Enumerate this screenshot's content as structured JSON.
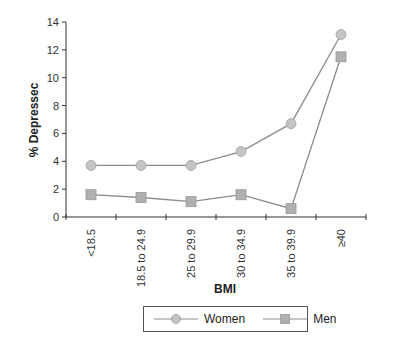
{
  "chart_data": {
    "type": "line",
    "title": "",
    "xlabel": "BMI",
    "ylabel": "% Depressec",
    "categories": [
      "<18.5",
      "18.5 to 24.9",
      "25 to 29.9",
      "30 to 34.9",
      "35 to 39.9",
      "≥40"
    ],
    "series": [
      {
        "name": "Women",
        "marker": "circle",
        "values": [
          3.7,
          3.7,
          3.7,
          4.7,
          6.7,
          13.1
        ]
      },
      {
        "name": "Men",
        "marker": "square",
        "values": [
          1.6,
          1.4,
          1.1,
          1.6,
          0.6,
          11.5
        ]
      }
    ],
    "ylim": [
      0,
      14
    ],
    "yticks": [
      0,
      2,
      4,
      6,
      8,
      10,
      12,
      14
    ],
    "grid": false,
    "legend_position": "bottom"
  },
  "colors": {
    "line": "#8c8c8c",
    "marker_fill": "#c4c4c4",
    "marker_fill_square": "#b0b0b0",
    "axis": "#333333"
  },
  "legend": {
    "items": [
      {
        "label": "Women",
        "marker": "circle"
      },
      {
        "label": "Men",
        "marker": "square"
      }
    ]
  }
}
